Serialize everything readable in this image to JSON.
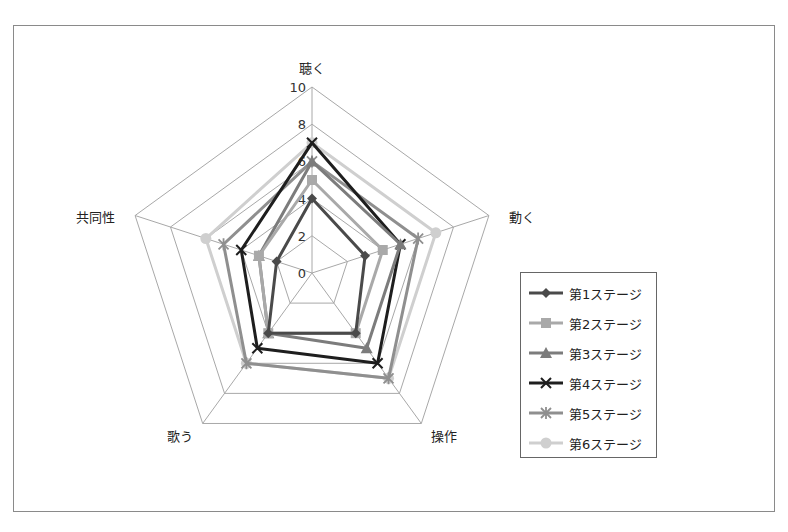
{
  "chart_data": {
    "type": "radar",
    "title": "",
    "categories": [
      "聴く",
      "動く",
      "操作",
      "歌う",
      "共同性"
    ],
    "range": [
      0,
      10
    ],
    "ticks": [
      0,
      2,
      4,
      6,
      8,
      10
    ],
    "tick_labels": [
      "0",
      "2",
      "4",
      "6",
      "8",
      "10"
    ],
    "grid": true,
    "legend_position": "right",
    "series": [
      {
        "name": "第1ステージ",
        "values": [
          4,
          3,
          4,
          4,
          2
        ],
        "color": "#4a4a4a",
        "marker": "diamond"
      },
      {
        "name": "第2ステージ",
        "values": [
          5,
          4,
          4,
          4,
          3
        ],
        "color": "#a9a9a9",
        "marker": "square"
      },
      {
        "name": "第3ステージ",
        "values": [
          6,
          5,
          5,
          4,
          3
        ],
        "color": "#7c7c7c",
        "marker": "triangle"
      },
      {
        "name": "第4ステージ",
        "values": [
          7,
          5,
          6,
          5,
          4
        ],
        "color": "#1e1e1e",
        "marker": "x"
      },
      {
        "name": "第5ステージ",
        "values": [
          6,
          6,
          7,
          6,
          5
        ],
        "color": "#8f8f8f",
        "marker": "star"
      },
      {
        "name": "第6ステージ",
        "values": [
          7,
          7,
          7,
          6,
          6
        ],
        "color": "#cfcfcf",
        "marker": "circle"
      }
    ]
  },
  "legend": {
    "items": [
      "第1ステージ",
      "第2ステージ",
      "第3ステージ",
      "第4ステージ",
      "第5ステージ",
      "第6ステージ"
    ]
  }
}
